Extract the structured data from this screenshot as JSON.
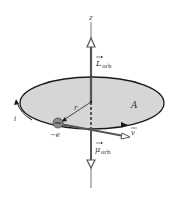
{
  "diagram": {
    "labels": {
      "z_axis": "z",
      "L_symbol": "L",
      "L_sub": "orb",
      "mu_symbol": "μ",
      "mu_sub": "orb",
      "radius": "r",
      "area": "A",
      "current": "i",
      "charge": "−e",
      "velocity": "v"
    },
    "colors": {
      "disk_fill": "#d6d6d6",
      "disk_stroke": "#1a1a1a",
      "axis": "#555555",
      "electron": "#8a8a8a",
      "text": "#333333"
    }
  }
}
